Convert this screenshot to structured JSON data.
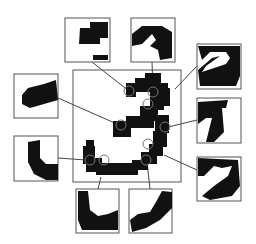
{
  "figure": {
    "digit": "3",
    "colors": {
      "ink": "#111111",
      "frame": "#555555",
      "line": "#444444",
      "background": "#ffffff"
    },
    "main_box": {
      "x": 73,
      "y": 70,
      "w": 108,
      "h": 112
    },
    "patches": [
      {
        "id": "p1",
        "x": 65,
        "y": 18,
        "w": 45,
        "h": 44,
        "anchor": [
          129,
          91
        ]
      },
      {
        "id": "p2",
        "x": 131,
        "y": 18,
        "w": 44,
        "h": 44,
        "anchor": [
          153,
          92
        ]
      },
      {
        "id": "p3",
        "x": 14,
        "y": 74,
        "w": 44,
        "h": 44,
        "anchor": [
          121,
          125
        ]
      },
      {
        "id": "p4",
        "x": 197,
        "y": 44,
        "w": 44,
        "h": 45,
        "anchor": [
          172,
          103
        ]
      },
      {
        "id": "p5",
        "x": 197,
        "y": 98,
        "w": 44,
        "h": 45,
        "anchor": [
          165,
          127
        ]
      },
      {
        "id": "p6",
        "x": 197,
        "y": 157,
        "w": 44,
        "h": 44,
        "anchor": [
          160,
          152
        ]
      },
      {
        "id": "p7",
        "x": 14,
        "y": 136,
        "w": 44,
        "h": 45,
        "anchor": [
          90,
          160
        ]
      },
      {
        "id": "p8",
        "x": 76,
        "y": 189,
        "w": 43,
        "h": 44,
        "anchor": [
          101,
          160
        ]
      },
      {
        "id": "p9",
        "x": 129,
        "y": 189,
        "w": 43,
        "h": 44,
        "anchor": [
          146,
          160
        ]
      }
    ]
  }
}
